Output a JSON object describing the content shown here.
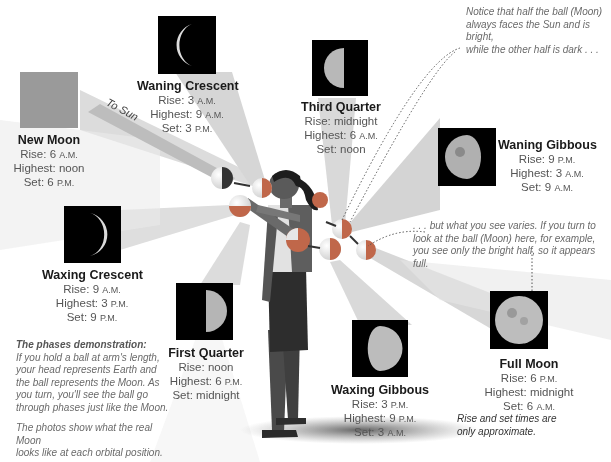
{
  "diagram": {
    "title": "The phases demonstration",
    "sun_label": "To Sun",
    "colors": {
      "beam": "#d0d0d0",
      "photo_bg": "#000000",
      "new_moon_fill": "#9a9a9a",
      "moon_light": "#dddddd",
      "ball_dark": "#c0674a"
    }
  },
  "phases": [
    {
      "id": "new-moon",
      "name": "New Moon",
      "rise": "Rise: 6",
      "rise_suffix": "A.M.",
      "highest": "Highest: noon",
      "highest_suffix": "",
      "set": "Set: 6",
      "set_suffix": "P.M."
    },
    {
      "id": "waning-crescent",
      "name": "Waning Crescent",
      "rise": "Rise: 3",
      "rise_suffix": "A.M.",
      "highest": "Highest: 9",
      "highest_suffix": "A.M.",
      "set": "Set: 3",
      "set_suffix": "P.M."
    },
    {
      "id": "third-quarter",
      "name": "Third Quarter",
      "rise": "Rise: midnight",
      "rise_suffix": "",
      "highest": "Highest: 6",
      "highest_suffix": "A.M.",
      "set": "Set: noon",
      "set_suffix": ""
    },
    {
      "id": "waning-gibbous",
      "name": "Waning Gibbous",
      "rise": "Rise: 9",
      "rise_suffix": "P.M.",
      "highest": "Highest: 3",
      "highest_suffix": "A.M.",
      "set": "Set: 9",
      "set_suffix": "A.M."
    },
    {
      "id": "full-moon",
      "name": "Full Moon",
      "rise": "Rise: 6",
      "rise_suffix": "P.M.",
      "highest": "Highest: midnight",
      "highest_suffix": "",
      "set": "Set: 6",
      "set_suffix": "A.M."
    },
    {
      "id": "waxing-gibbous",
      "name": "Waxing Gibbous",
      "rise": "Rise: 3",
      "rise_suffix": "P.M.",
      "highest": "Highest: 9",
      "highest_suffix": "P.M.",
      "set": "Set: 3",
      "set_suffix": "A.M."
    },
    {
      "id": "first-quarter",
      "name": "First Quarter",
      "rise": "Rise: noon",
      "rise_suffix": "",
      "highest": "Highest: 6",
      "highest_suffix": "P.M.",
      "set": "Set: midnight",
      "set_suffix": ""
    },
    {
      "id": "waxing-crescent",
      "name": "Waxing Crescent",
      "rise": "Rise: 9",
      "rise_suffix": "A.M.",
      "highest": "Highest: 3",
      "highest_suffix": "P.M.",
      "set": "Set: 9",
      "set_suffix": "P.M."
    }
  ],
  "notes": {
    "half_faces_sun": [
      "Notice that half the ball (Moon)",
      "always faces the Sun and is bright,",
      "while the other half is dark . . ."
    ],
    "what_you_see": [
      ". . . but what you see varies. If you turn to",
      "look at the ball (Moon) here, for example,",
      "you see only the bright half, so it appears full."
    ],
    "demo_title": "The phases demonstration:",
    "demo_body": [
      "If you hold a ball at arm's length,",
      "your head represents Earth and",
      "the ball represents the Moon. As",
      "you turn, you'll see the ball go",
      "through phases just like the Moon."
    ],
    "photos": [
      "The photos show what the real Moon",
      "looks like at each orbital position."
    ],
    "approx": [
      "Rise and set times are",
      "only approximate."
    ]
  }
}
